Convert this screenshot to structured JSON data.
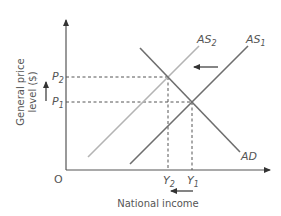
{
  "diagram": {
    "title": "",
    "origin_label": "O",
    "y_axis": {
      "label_line1": "General price",
      "label_line2": "level ($)",
      "ticks": [
        {
          "name": "P",
          "sub": "2"
        },
        {
          "name": "P",
          "sub": "1"
        }
      ]
    },
    "x_axis": {
      "label": "National income",
      "ticks": [
        {
          "name": "Y",
          "sub": "2"
        },
        {
          "name": "Y",
          "sub": "1"
        }
      ]
    },
    "curves": [
      {
        "id": "AS1",
        "name": "AS",
        "sub": "1",
        "color": "#6e6e6e"
      },
      {
        "id": "AS2",
        "name": "AS",
        "sub": "2",
        "color": "#b4b4b4"
      },
      {
        "id": "AD",
        "name": "AD",
        "sub": "",
        "color": "#6e6e6e"
      }
    ],
    "annotations": {
      "shift_arrow": "leftward shift of AS",
      "price_arrow": "price level rises P1 to P2",
      "income_arrow": "national income falls Y1 to Y2"
    },
    "colors": {
      "axis": "#555555",
      "dashed": "#555555",
      "text": "#555555"
    }
  }
}
